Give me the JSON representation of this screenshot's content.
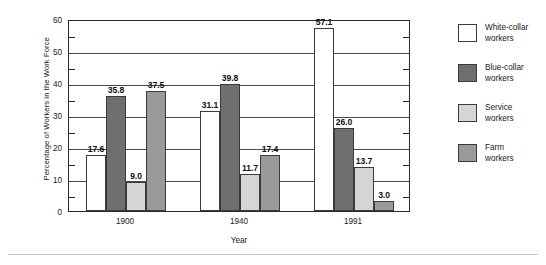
{
  "chart_data": {
    "type": "bar",
    "title": "",
    "xlabel": "Year",
    "ylabel_line1": "Percentage of Workers",
    "ylabel_line2": "in the Work Force",
    "categories": [
      "1900",
      "1940",
      "1991"
    ],
    "ylim": [
      0,
      60
    ],
    "yticks": [
      "0",
      "10",
      "20",
      "30",
      "40",
      "50",
      "60"
    ],
    "ytick_values": [
      0,
      10,
      20,
      30,
      40,
      50,
      60
    ],
    "minor_tick_values": [
      5,
      15,
      25,
      35,
      45,
      55
    ],
    "grid": "horizontal-major",
    "legend_position": "right",
    "series": [
      {
        "name": "White-collar workers",
        "legend_line1": "White-collar",
        "legend_line2": "workers",
        "color": "#ffffff",
        "values": [
          17.6,
          31.1,
          57.1
        ],
        "labels": [
          "17.6",
          "31.1",
          "57.1"
        ]
      },
      {
        "name": "Blue-collar workers",
        "legend_line1": "Blue-collar",
        "legend_line2": "workers",
        "color": "#6f6f6f",
        "values": [
          35.8,
          39.8,
          26.0
        ],
        "labels": [
          "35.8",
          "39.8",
          "26.0"
        ]
      },
      {
        "name": "Service workers",
        "legend_line1": "Service",
        "legend_line2": "workers",
        "color": "#d5d5d5",
        "values": [
          9.0,
          11.7,
          13.7
        ],
        "labels": [
          "9.0",
          "11.7",
          "13.7"
        ]
      },
      {
        "name": "Farm workers",
        "legend_line1": "Farm",
        "legend_line2": "workers",
        "color": "#9a9a9a",
        "values": [
          37.5,
          17.4,
          3.0
        ],
        "labels": [
          "37.5",
          "17.4",
          "3.0"
        ]
      }
    ]
  }
}
